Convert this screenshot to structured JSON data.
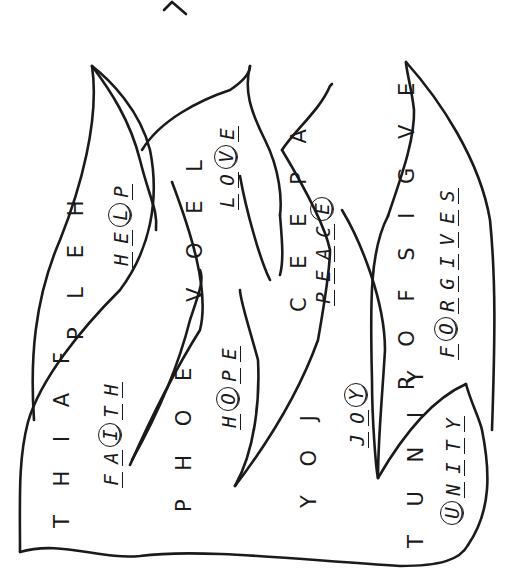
{
  "worksheet": {
    "title_fragment": "Y",
    "orientation": "rotated-90-ccw",
    "stroke_color": "#1a1a1a",
    "background": "#ffffff"
  },
  "words": [
    {
      "id": "faith",
      "scrambled": "T H I A F",
      "answer": [
        "F",
        "A",
        "I",
        "T",
        "H"
      ],
      "circled_index": 2
    },
    {
      "id": "help",
      "scrambled": "P L E H",
      "answer": [
        "H",
        "E",
        "L",
        "P"
      ],
      "circled_index": 2
    },
    {
      "id": "hope",
      "scrambled": "P H O E",
      "answer": [
        "H",
        "O",
        "P",
        "E"
      ],
      "circled_index": 1
    },
    {
      "id": "love",
      "scrambled": "V O E L",
      "answer": [
        "L",
        "O",
        "V",
        "E"
      ],
      "circled_index": 2
    },
    {
      "id": "joy",
      "scrambled": "Y O J",
      "answer": [
        "J",
        "O",
        "Y"
      ],
      "circled_index": 2
    },
    {
      "id": "peace",
      "scrambled": "C E E P A",
      "answer": [
        "P",
        "E",
        "A",
        "C",
        "E"
      ],
      "circled_index": 4
    },
    {
      "id": "unity",
      "scrambled": "T U N I Y",
      "answer": [
        "U",
        "N",
        "I",
        "T",
        "Y"
      ],
      "circled_index": 0
    },
    {
      "id": "forgives",
      "scrambled": "R O F S I G V E",
      "answer": [
        "F",
        "O",
        "R",
        "G",
        "I",
        "V",
        "E",
        "S"
      ],
      "circled_index": 1
    }
  ]
}
